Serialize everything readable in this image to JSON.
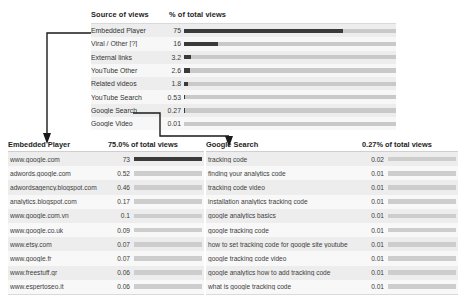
{
  "chart_data": {
    "type": "bar",
    "title": "Source of views",
    "xlabel": "% of total views",
    "ylabel": "",
    "categories": [
      "Embedded Player",
      "Viral / Other [?]",
      "External links",
      "YouTube Other",
      "Related videos",
      "YouTube Search",
      "Google Search",
      "Google Video"
    ],
    "values": [
      75,
      16,
      3.2,
      2.6,
      1.8,
      0.53,
      0.27,
      0.01
    ],
    "value_labels": [
      "75",
      "16",
      "3.2",
      "2.6",
      "1.8",
      "0.53",
      "0.27",
      "0.01"
    ],
    "xlim": [
      0,
      100
    ],
    "grid": false,
    "legend": "none",
    "note": "Grayscale analytics report; horizontal bars on gray tracks"
  },
  "top_table": {
    "col_source": "Source of views",
    "col_pct": "% of total views",
    "rows": [
      {
        "label": "Embedded Player",
        "value": "75",
        "pct": 75,
        "link": true
      },
      {
        "label": "Viral / Other [?]",
        "value": "16",
        "pct": 16,
        "link": false
      },
      {
        "label": "External links",
        "value": "3.2",
        "pct": 3.2,
        "link": true
      },
      {
        "label": "YouTube Other",
        "value": "2.6",
        "pct": 2.6,
        "link": true
      },
      {
        "label": "Related videos",
        "value": "1.8",
        "pct": 1.8,
        "link": true
      },
      {
        "label": "YouTube Search",
        "value": "0.53",
        "pct": 0.53,
        "link": true
      },
      {
        "label": "Google Search",
        "value": "0.27",
        "pct": 0.27,
        "link": true
      },
      {
        "label": "Google Video",
        "value": "0.01",
        "pct": 0.01,
        "link": true
      }
    ]
  },
  "left_table": {
    "title": "Embedded Player",
    "subtitle": "75.0% of total views",
    "rows": [
      {
        "label": "www.google.com",
        "value": "73",
        "pct": 100
      },
      {
        "label": "adwords.google.com",
        "value": "0.52",
        "pct": 0
      },
      {
        "label": "adwordsagency.blogspot.com",
        "value": "0.46",
        "pct": 0
      },
      {
        "label": "analytics.blogspot.com",
        "value": "0.17",
        "pct": 0
      },
      {
        "label": "www.google.com.vn",
        "value": "0.1",
        "pct": 0
      },
      {
        "label": "www.google.co.uk",
        "value": "0.09",
        "pct": 0
      },
      {
        "label": "www.etsy.com",
        "value": "0.07",
        "pct": 0
      },
      {
        "label": "www.google.fr",
        "value": "0.07",
        "pct": 0
      },
      {
        "label": "www.freestuff.gr",
        "value": "0.06",
        "pct": 0
      },
      {
        "label": "www.espertoseo.it",
        "value": "0.06",
        "pct": 0
      }
    ]
  },
  "right_table": {
    "title": "Google Search",
    "subtitle": "0.27% of total views",
    "rows": [
      {
        "label": "tracking code",
        "value": "0.02",
        "pct": 0
      },
      {
        "label": "finding your analytics code",
        "value": "0.01",
        "pct": 0
      },
      {
        "label": "tracking code video",
        "value": "0.01",
        "pct": 0
      },
      {
        "label": "installation analytics tracking code",
        "value": "0.01",
        "pct": 0
      },
      {
        "label": "google analytics basics",
        "value": "0.01",
        "pct": 0
      },
      {
        "label": "google tracking code",
        "value": "0.01",
        "pct": 0
      },
      {
        "label": "how to set tracking code for google site youtube",
        "value": "0.01",
        "pct": 0
      },
      {
        "label": "google tracking code video",
        "value": "0.01",
        "pct": 0
      },
      {
        "label": "google analytics how to add tracking code",
        "value": "0.01",
        "pct": 0
      },
      {
        "label": "what is google tracking code",
        "value": "0.01",
        "pct": 0
      }
    ]
  },
  "connectors": {
    "left_arrow_name": "embedded-player-drilldown-arrow",
    "right_arrow_name": "google-search-drilldown-arrow"
  },
  "colors": {
    "bar_fill": "#3a3a3a",
    "bar_track": "#c9c9c9",
    "row_odd": "#ededed",
    "row_even": "#f8f8f8",
    "text": "#3a3a3a"
  }
}
